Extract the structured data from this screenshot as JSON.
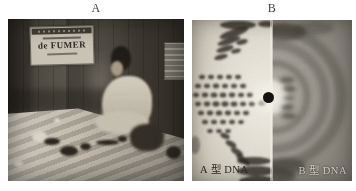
{
  "figure": {
    "panel_a": {
      "label": "A",
      "photo_description": "black-and-white photograph of a woman seated at a workshop table",
      "wall_sign": {
        "main_text": "de FUMER"
      }
    },
    "panel_b": {
      "label": "B",
      "photo_description": "composite X-ray diffraction photograph of DNA fibres",
      "caption_left": "A 型 DNA",
      "caption_right": "B 型 DNA"
    }
  },
  "colors": {
    "page_background": "#ffffff",
    "panel_label": "#3f3f3f",
    "caption_dark": "#2e2a23",
    "caption_light": "#ddd8cb",
    "sign_background": "#ccc7b9",
    "beam_stop": "#15130f"
  }
}
